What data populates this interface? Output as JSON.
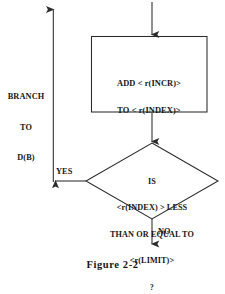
{
  "figure": {
    "caption": "Figure 2-2",
    "type": "flowchart",
    "background_color": "#ffffff",
    "line_color": "#2b2b2b",
    "text_color": "#161616"
  },
  "nodes": {
    "process": {
      "shape": "rectangle",
      "lines": [
        "ADD < r(INCR)>",
        "TO < r(INDEX)>"
      ]
    },
    "decision": {
      "shape": "diamond",
      "lines": [
        "IS",
        "<r(INDEX) > LESS",
        "THAN OR EQUAL TO",
        "<r(LIMIT)>",
        "?"
      ]
    }
  },
  "labels": {
    "branch": {
      "lines": [
        "BRANCH",
        "TO",
        "D(B)"
      ]
    },
    "yes": "YES",
    "no": "NO"
  },
  "edges": [
    {
      "name": "entry-arrow",
      "from": "top",
      "to": "process",
      "direction": "down",
      "label": ""
    },
    {
      "name": "process-to-decision-arrow",
      "from": "process",
      "to": "decision",
      "direction": "down",
      "label": ""
    },
    {
      "name": "yes-branch-arrow",
      "from": "decision",
      "to": "branch-riser",
      "direction": "left",
      "label": "YES"
    },
    {
      "name": "branch-return-arrow",
      "from": "branch-riser",
      "to": "top",
      "direction": "up",
      "label": "BRANCH TO D(B)"
    },
    {
      "name": "no-exit-arrow",
      "from": "decision",
      "to": "bottom",
      "direction": "down",
      "label": "NO"
    }
  ]
}
